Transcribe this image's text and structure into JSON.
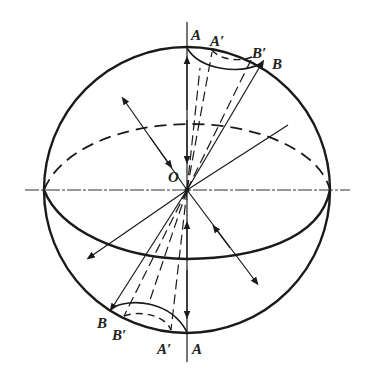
{
  "diagram": {
    "type": "sphere-rotation-diagram",
    "labels": {
      "center": "O",
      "top_A": "A",
      "top_A_prime": "A′",
      "top_B_prime": "B′",
      "top_B": "B",
      "bottom_B": "B",
      "bottom_B_prime": "B′",
      "bottom_A_prime": "A′",
      "bottom_A": "A"
    },
    "colors": {
      "ink": "#1a1a1a",
      "background": "#ffffff"
    }
  }
}
